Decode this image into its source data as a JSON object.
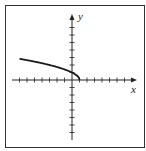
{
  "chart_data": {
    "type": "line",
    "title": "",
    "xlabel": "x",
    "ylabel": "y",
    "function": "y = sqrt(1 - x)",
    "xlim": [
      -8,
      8
    ],
    "ylim": [
      -8,
      8
    ],
    "grid": false,
    "x_ticks_each_side": 7,
    "y_ticks_each_side": 7,
    "series": [
      {
        "name": "curve",
        "x": [
          -7,
          -6,
          -5,
          -4,
          -3,
          -2,
          -1,
          0,
          0.5,
          1
        ],
        "y": [
          2.83,
          2.65,
          2.45,
          2.24,
          2.0,
          1.73,
          1.41,
          1.0,
          0.71,
          0
        ]
      }
    ]
  },
  "labels": {
    "x": "x",
    "y": "y"
  },
  "colors": {
    "axis": "#222222",
    "curve": "#1a1a1a",
    "frame": "#333333"
  }
}
